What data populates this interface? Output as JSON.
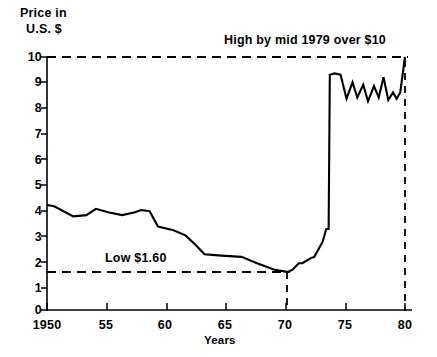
{
  "chart_data": {
    "type": "line",
    "title": "",
    "subtitle": "",
    "ylabel_line1": "Price in",
    "ylabel_line2": "U.S. $",
    "xlabel": "Years",
    "xlim": [
      1950,
      1980
    ],
    "ylim": [
      0,
      10
    ],
    "grid": false,
    "legend": null,
    "yticks": [
      0,
      1,
      2,
      3,
      4,
      5,
      6,
      7,
      8,
      9,
      10
    ],
    "ytick_labels": [
      "0",
      "1",
      "2",
      "3",
      "4",
      "5",
      "6",
      "7",
      "8",
      "9",
      "10"
    ],
    "xticks": [
      1950,
      1955,
      1960,
      1965,
      1970,
      1975,
      1980
    ],
    "xtick_labels": [
      "1950",
      "55",
      "60",
      "65",
      "70",
      "75",
      "80"
    ],
    "line_color": "#000000",
    "series": [
      {
        "name": "Price in U.S. $",
        "x": [
          1950.0,
          1950.6,
          1952.2,
          1953.3,
          1954.1,
          1955.2,
          1956.3,
          1957.3,
          1957.9,
          1958.6,
          1959.3,
          1960.6,
          1961.6,
          1962.4,
          1963.2,
          1964.6,
          1966.3,
          1967.6,
          1969.0,
          1970.2,
          1970.6,
          1971.1,
          1971.4,
          1972.1,
          1972.4,
          1973.1,
          1973.4,
          1973.6,
          1973.7,
          1974.1,
          1974.6,
          1975.1,
          1975.6,
          1976.0,
          1976.5,
          1976.9,
          1977.4,
          1977.8,
          1978.2,
          1978.6,
          1979.0,
          1979.3,
          1979.6,
          1980.0
        ],
        "y": [
          4.15,
          4.1,
          3.7,
          3.75,
          4.0,
          3.85,
          3.75,
          3.85,
          3.95,
          3.9,
          3.3,
          3.15,
          2.95,
          2.6,
          2.2,
          2.15,
          2.1,
          1.85,
          1.6,
          1.5,
          1.6,
          1.85,
          1.85,
          2.05,
          2.1,
          2.7,
          3.2,
          3.2,
          9.3,
          9.35,
          9.3,
          8.35,
          9.0,
          8.4,
          8.9,
          8.25,
          8.85,
          8.4,
          9.2,
          8.3,
          8.6,
          8.35,
          8.6,
          10.0
        ]
      }
    ],
    "reference_lines": [
      {
        "name": "high-reference-line",
        "orientation": "horizontal",
        "value": 10,
        "style": "dashed",
        "label": "High by mid 1979 over $10"
      },
      {
        "name": "low-reference-line",
        "orientation": "horizontal",
        "value": 1.6,
        "style": "dashed",
        "label": "Low $1.60"
      },
      {
        "name": "year-1970-marker",
        "orientation": "vertical",
        "value": 1970,
        "style": "dashed",
        "label": ""
      },
      {
        "name": "year-1980-marker",
        "orientation": "vertical",
        "value": 1980,
        "style": "dashed",
        "label": ""
      }
    ],
    "annotations": [
      {
        "name": "high-annotation",
        "text": "High by mid 1979 over $10"
      },
      {
        "name": "low-annotation",
        "text": "Low $1.60"
      }
    ]
  }
}
